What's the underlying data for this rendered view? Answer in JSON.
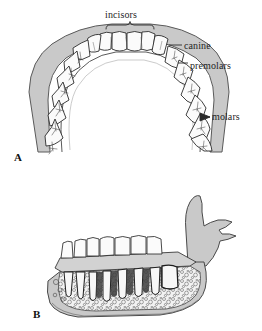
{
  "figure": {
    "background_color": "#ffffff",
    "bone_color": "#c9c9c9",
    "bone_edge_color": "#5a5a5a",
    "tooth_color": "#fbfbfb",
    "tooth_edge_color": "#2b2b2b",
    "spongy_bone_color": "#efefef",
    "line_color": "#2b2b2b",
    "label_color": "#1f1f1f"
  },
  "panels": [
    {
      "id": "A",
      "letter": "A",
      "view": "occlusal view of mandibular dental arch",
      "labels": [
        {
          "key": "incisors",
          "text": "incisors",
          "marker": "brace"
        },
        {
          "key": "canine",
          "text": "canine",
          "marker": "leader-line"
        },
        {
          "key": "premolars",
          "text": "premolars",
          "marker": "leader-line"
        },
        {
          "key": "molars",
          "text": "molars",
          "marker": "arrow"
        }
      ],
      "tooth_counts": {
        "incisors": 4,
        "canines": 2,
        "premolars": 4,
        "molars": 6
      }
    },
    {
      "id": "B",
      "letter": "B",
      "view": "lateral cutaway of mandible showing tooth roots in spongy bone",
      "labels": []
    }
  ],
  "labels": {
    "incisors": "incisors",
    "canine": "canine",
    "premolars": "premolars",
    "molars": "molars",
    "panel_a": "A",
    "panel_b": "B"
  }
}
